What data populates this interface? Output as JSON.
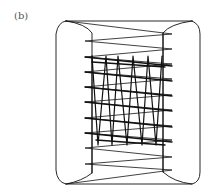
{
  "figure": {
    "panel_label": "(b)",
    "stroke_color": "#111111",
    "background": "#ffffff",
    "outer_box": {
      "left": 55,
      "right": 200,
      "top": 20,
      "bottom": 185
    },
    "cushions": {
      "left_inner_x": 92,
      "right_inner_x": 163
    },
    "horizontal_zigzag": {
      "left_x": 85,
      "right_x": 172,
      "y_levels": [
        34,
        41,
        57,
        72,
        87,
        102,
        118,
        133,
        148,
        157,
        164,
        176
      ]
    },
    "vertical_zigzag": {
      "top_y": 56,
      "bottom_y": 145,
      "top_x": [
        92,
        106,
        118,
        133,
        148,
        162
      ],
      "bottom_x": [
        98,
        112,
        127,
        142,
        156
      ]
    }
  }
}
